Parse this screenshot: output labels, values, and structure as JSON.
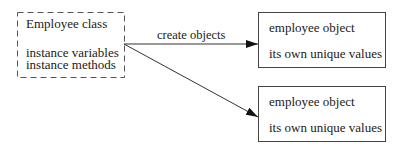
{
  "class_box": {
    "title": "Employee class",
    "lines": [
      "instance variables",
      "instance methods"
    ],
    "style": "dashed"
  },
  "arrow_label": "create objects",
  "objects": [
    {
      "title": "employee object",
      "subtitle": "its own unique values"
    },
    {
      "title": "employee object",
      "subtitle": "its own unique values"
    }
  ],
  "colors": {
    "stroke": "#333333",
    "text": "#1a1a1a"
  }
}
